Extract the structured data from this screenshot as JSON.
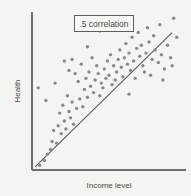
{
  "chart_data": {
    "type": "scatter",
    "title": "",
    "xlabel": "Income level",
    "ylabel": "Health",
    "xlim": [
      0,
      100
    ],
    "ylim": [
      0,
      100
    ],
    "grid": false,
    "legend_position": "none",
    "annotation_label": ".5 correlation",
    "correlation": 0.5,
    "point_color": "#8a8a8a",
    "line_color": "#5a5a5a",
    "axis_color": "#6e6e6e",
    "background_color": "#f4f4f2",
    "trend_line": {
      "visible": true,
      "x_start": 2,
      "y_start": 2,
      "x_end": 91,
      "y_end": 87
    },
    "points": [
      [
        5,
        3
      ],
      [
        8,
        6
      ],
      [
        10,
        10
      ],
      [
        12,
        13
      ],
      [
        13,
        18
      ],
      [
        16,
        17
      ],
      [
        14,
        25
      ],
      [
        17,
        28
      ],
      [
        19,
        23
      ],
      [
        21,
        31
      ],
      [
        22,
        26
      ],
      [
        24,
        37
      ],
      [
        25,
        33
      ],
      [
        26,
        43
      ],
      [
        23,
        47
      ],
      [
        20,
        41
      ],
      [
        18,
        36
      ],
      [
        27,
        29
      ],
      [
        29,
        39
      ],
      [
        31,
        45
      ],
      [
        33,
        40
      ],
      [
        34,
        51
      ],
      [
        36,
        46
      ],
      [
        30,
        56
      ],
      [
        28,
        61
      ],
      [
        32,
        67
      ],
      [
        26,
        70
      ],
      [
        24,
        63
      ],
      [
        35,
        58
      ],
      [
        37,
        62
      ],
      [
        38,
        53
      ],
      [
        40,
        49
      ],
      [
        41,
        57
      ],
      [
        43,
        61
      ],
      [
        45,
        55
      ],
      [
        42,
        66
      ],
      [
        39,
        71
      ],
      [
        44,
        47
      ],
      [
        46,
        52
      ],
      [
        48,
        58
      ],
      [
        47,
        64
      ],
      [
        50,
        60
      ],
      [
        52,
        54
      ],
      [
        49,
        69
      ],
      [
        51,
        73
      ],
      [
        53,
        66
      ],
      [
        55,
        62
      ],
      [
        54,
        57
      ],
      [
        56,
        70
      ],
      [
        58,
        65
      ],
      [
        57,
        76
      ],
      [
        60,
        71
      ],
      [
        62,
        67
      ],
      [
        59,
        59
      ],
      [
        61,
        80
      ],
      [
        63,
        74
      ],
      [
        64,
        63
      ],
      [
        66,
        69
      ],
      [
        65,
        84
      ],
      [
        68,
        77
      ],
      [
        67,
        58
      ],
      [
        70,
        72
      ],
      [
        72,
        66
      ],
      [
        69,
        87
      ],
      [
        71,
        79
      ],
      [
        74,
        74
      ],
      [
        73,
        62
      ],
      [
        76,
        81
      ],
      [
        78,
        70
      ],
      [
        75,
        90
      ],
      [
        77,
        60
      ],
      [
        80,
        76
      ],
      [
        82,
        68
      ],
      [
        79,
        85
      ],
      [
        84,
        73
      ],
      [
        86,
        64
      ],
      [
        83,
        92
      ],
      [
        88,
        79
      ],
      [
        90,
        71
      ],
      [
        92,
        96
      ],
      [
        94,
        84
      ],
      [
        91,
        66
      ],
      [
        4,
        52
      ],
      [
        9,
        44
      ],
      [
        15,
        55
      ],
      [
        36,
        78
      ],
      [
        44,
        88
      ],
      [
        21,
        69
      ],
      [
        63,
        48
      ],
      [
        85,
        57
      ]
    ]
  },
  "axes": {
    "x_axis_name": "x-axis",
    "y_axis_name": "y-axis"
  }
}
